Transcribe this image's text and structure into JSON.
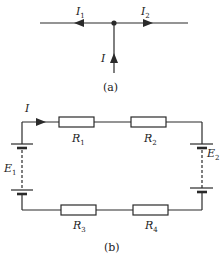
{
  "diagram_a": {
    "caption": "(a)",
    "labels": {
      "left_current": "I",
      "left_current_sub": "1",
      "right_current": "I",
      "right_current_sub": "2",
      "input_current": "I"
    },
    "description": "Junction node with incoming current I from below, splitting into I1 flowing left and I2 flowing right"
  },
  "diagram_b": {
    "caption": "(b)",
    "current_label": "I",
    "resistors": [
      {
        "name": "R",
        "sub": "1"
      },
      {
        "name": "R",
        "sub": "2"
      },
      {
        "name": "R",
        "sub": "3"
      },
      {
        "name": "R",
        "sub": "4"
      }
    ],
    "sources": [
      {
        "name": "E",
        "sub": "1"
      },
      {
        "name": "E",
        "sub": "2"
      }
    ],
    "description": "Series loop circuit with battery E1 on left, E2 on right, R1 and R2 on top branch, R3 and R4 on bottom branch, current I clockwise"
  },
  "colors": {
    "line": "#2a2a2a",
    "background": "#ffffff"
  }
}
